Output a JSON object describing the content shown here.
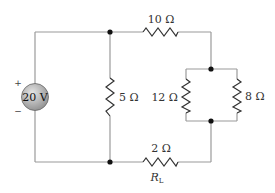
{
  "diagram": {
    "type": "circuit",
    "source": {
      "label": "20 V",
      "plus": "+",
      "minus": "−"
    },
    "resistors": [
      {
        "id": "r5",
        "label": "5 Ω",
        "value_ohms": 5,
        "orientation": "vertical"
      },
      {
        "id": "r10",
        "label": "10 Ω",
        "value_ohms": 10,
        "orientation": "horizontal"
      },
      {
        "id": "r12",
        "label": "12 Ω",
        "value_ohms": 12,
        "orientation": "vertical"
      },
      {
        "id": "r8",
        "label": "8 Ω",
        "value_ohms": 8,
        "orientation": "vertical"
      },
      {
        "id": "rl",
        "label": "2 Ω",
        "value_ohms": 2,
        "orientation": "horizontal",
        "name": "R",
        "name_sub": "L"
      }
    ],
    "colors": {
      "wire": "#9a9a9a",
      "resistor": "#333333",
      "node": "#111111",
      "source_fill": "#a8a8a8"
    }
  }
}
